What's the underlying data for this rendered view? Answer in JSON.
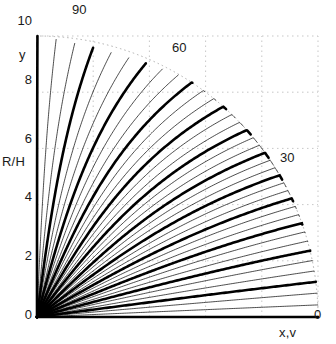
{
  "chart_data": {
    "type": "line",
    "title": "",
    "xlabel": "x,v",
    "ylabel": "R/H",
    "ylabel_secondary": "y",
    "xlim": [
      0,
      10
    ],
    "ylim": [
      0,
      10
    ],
    "grid": true,
    "grid_style": "dotted",
    "axis_style": "dashed",
    "legend": "none",
    "y_ticks": [
      0,
      2,
      4,
      6,
      8,
      10
    ],
    "y_tick_labels": [
      "0",
      "2",
      "4",
      "6",
      "8",
      "10"
    ],
    "x_ticks": [
      0,
      2,
      4,
      6,
      8,
      10
    ],
    "x_tick_labels": [
      "",
      "",
      "",
      "",
      "",
      ""
    ],
    "angle_ticks": [
      0,
      30,
      60,
      90
    ],
    "angle_tick_labels": [
      "0",
      "30",
      "60",
      "90"
    ],
    "arc_radius": 10,
    "curve_count": 37,
    "curve_angle_start": 0,
    "curve_angle_end": 90,
    "curve_angle_step": 2.5,
    "emphasis_every": 3,
    "thick_line_width": 2.6,
    "thin_line_width": 0.7,
    "curve_color": "#000000",
    "grid_color": "#b9b9b9",
    "axis_color": "#8c8c8c",
    "arc_color": "#b0b0b0",
    "series_note": "Each curve leaves the origin at a fixed angle and asymptotically bends toward the horizontal, producing a radial fan."
  },
  "labels": {
    "angle_90": "90",
    "angle_60": "60",
    "angle_30": "30",
    "angle_0": "0",
    "y_axis_name": "y",
    "r_over_h": "R/H",
    "x_axis_name": "x,v",
    "tick_10": "10",
    "tick_8": "8",
    "tick_6": "6",
    "tick_4": "4",
    "tick_2": "2",
    "tick_0": "0"
  }
}
